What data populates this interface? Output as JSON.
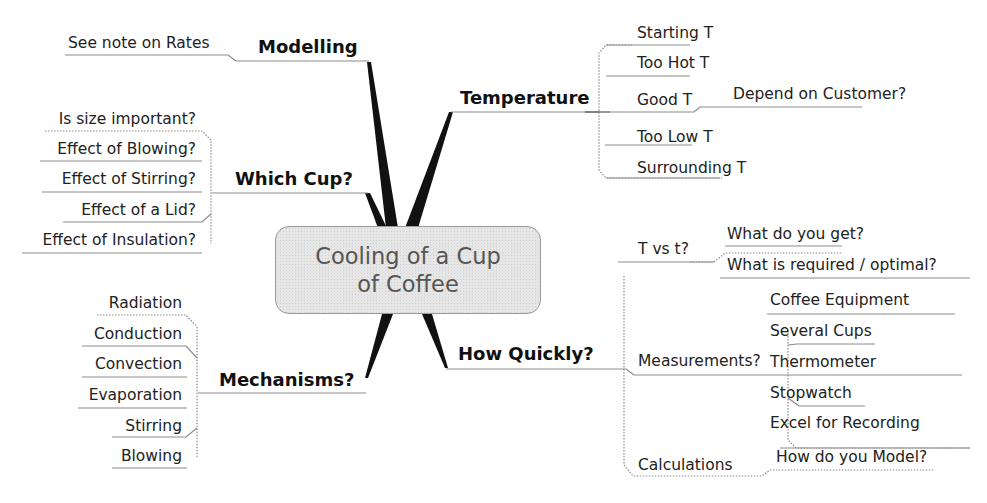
{
  "title": {
    "line1": "Cooling of a Cup",
    "line2": "of Coffee"
  },
  "branches": {
    "modelling": {
      "label": "Modelling",
      "children": [
        "See note on Rates"
      ]
    },
    "temperature": {
      "label": "Temperature",
      "children": [
        "Starting T",
        "Too Hot T",
        "Good T",
        "Too Low T",
        "Surrounding T"
      ],
      "good_t_child": "Depend on Customer?"
    },
    "which_cup": {
      "label": "Which Cup?",
      "children": [
        "Is size important?",
        "Effect of Blowing?",
        "Effect of Stirring?",
        "Effect of a Lid?",
        "Effect of Insulation?"
      ]
    },
    "mechanisms": {
      "label": "Mechanisms?",
      "children": [
        "Radiation",
        "Conduction",
        "Convection",
        "Evaporation",
        "Stirring",
        "Blowing"
      ]
    },
    "how_quickly": {
      "label": "How Quickly?",
      "t_vs_t": {
        "label": "T vs t?",
        "children": [
          "What do you get?",
          "What is required / optimal?"
        ]
      },
      "measurements": {
        "label": "Measurements?",
        "children": [
          "Coffee Equipment",
          "Several Cups",
          "Thermometer",
          "Stopwatch",
          "Excel for Recording"
        ]
      },
      "calculations": {
        "label": "Calculations",
        "children": [
          "How do you Model?"
        ]
      }
    }
  },
  "colors": {
    "spoke": "#111111",
    "connector": "#9a9a9a",
    "central_fill": "#e6e6e6",
    "central_text": "#555555"
  }
}
